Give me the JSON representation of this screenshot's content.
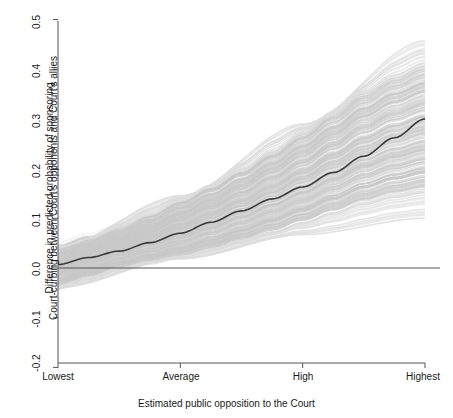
{
  "chart_data": {
    "type": "line",
    "title": "",
    "subtitle": "",
    "xlabel": "Estimated public opposition to the Court",
    "ylabel_line1": "Difference in predicted probability of sponsoring",
    "ylabel_line2": "Court-curbing between Court's opponents and Court's allies",
    "grid": false,
    "legend_position": "none",
    "xlim": [
      0,
      3
    ],
    "ylim": [
      -0.2,
      0.5
    ],
    "x_tick_labels": [
      "Lowest",
      "Average",
      "High",
      "Highest"
    ],
    "x_tick_values": [
      0,
      1,
      2,
      3
    ],
    "y_tick_labels": [
      "-0.2",
      "-0.1",
      "0.0",
      "0.1",
      "0.2",
      "0.3",
      "0.4",
      "0.5"
    ],
    "y_tick_values": [
      -0.2,
      -0.1,
      0.0,
      0.1,
      0.2,
      0.3,
      0.4,
      0.5
    ],
    "reference_line": {
      "y": 0.0,
      "orientation": "horizontal",
      "color": "#555555"
    },
    "colors": {
      "median_line": "#3a3a3a",
      "uncertainty_band": "#c9c9c9",
      "stray_lines": "#dcdcdc",
      "axis": "#555555",
      "text": "#1a1a1a",
      "background": "#ffffff"
    },
    "series": [
      {
        "name": "Median estimate",
        "style": "solid-dark-line",
        "x": [
          0.0,
          0.25,
          0.5,
          0.75,
          1.0,
          1.25,
          1.5,
          1.75,
          2.0,
          2.25,
          2.5,
          2.75,
          3.0
        ],
        "values": [
          0.007,
          0.021,
          0.034,
          0.051,
          0.07,
          0.092,
          0.115,
          0.139,
          0.163,
          0.192,
          0.225,
          0.262,
          0.3
        ]
      },
      {
        "name": "Simulation envelope upper (dense)",
        "style": "band-edge",
        "x": [
          0.0,
          0.25,
          0.5,
          0.75,
          1.0,
          1.25,
          1.5,
          1.75,
          2.0,
          2.25,
          2.5,
          2.75,
          3.0
        ],
        "values": [
          0.04,
          0.059,
          0.08,
          0.105,
          0.134,
          0.163,
          0.196,
          0.232,
          0.27,
          0.311,
          0.352,
          0.384,
          0.408
        ]
      },
      {
        "name": "Simulation envelope lower (dense)",
        "style": "band-edge",
        "x": [
          0.0,
          0.25,
          0.5,
          0.75,
          1.0,
          1.25,
          1.5,
          1.75,
          2.0,
          2.25,
          2.5,
          2.75,
          3.0
        ],
        "values": [
          -0.035,
          -0.017,
          0.001,
          0.013,
          0.024,
          0.039,
          0.056,
          0.074,
          0.093,
          0.113,
          0.133,
          0.148,
          0.158
        ]
      },
      {
        "name": "Sparse outer simulations upper",
        "style": "stray-lines",
        "x": [
          0.0,
          1.0,
          2.0,
          3.0
        ],
        "values": [
          0.044,
          0.147,
          0.292,
          0.462
        ]
      },
      {
        "name": "Sparse outer simulations lower",
        "style": "stray-lines",
        "x": [
          0.0,
          1.0,
          2.0,
          3.0
        ],
        "values": [
          -0.04,
          0.018,
          0.066,
          0.098
        ]
      }
    ],
    "annotations": [
      {
        "text": "Gray region: simulated posterior draws; dark line: median estimate"
      }
    ]
  },
  "axes": {
    "x_tick_labels": [
      "Lowest",
      "Average",
      "High",
      "Highest"
    ],
    "y_tick_labels": [
      "0.5",
      "0.4",
      "0.3",
      "0.2",
      "0.1",
      "0.0",
      "-0.1",
      "-0.2"
    ],
    "x_title": "Estimated public opposition to the Court",
    "y_title_line1": "Difference in predicted probability of sponsoring",
    "y_title_line2": "Court-curbing between Court's opponents and Court's allies"
  }
}
